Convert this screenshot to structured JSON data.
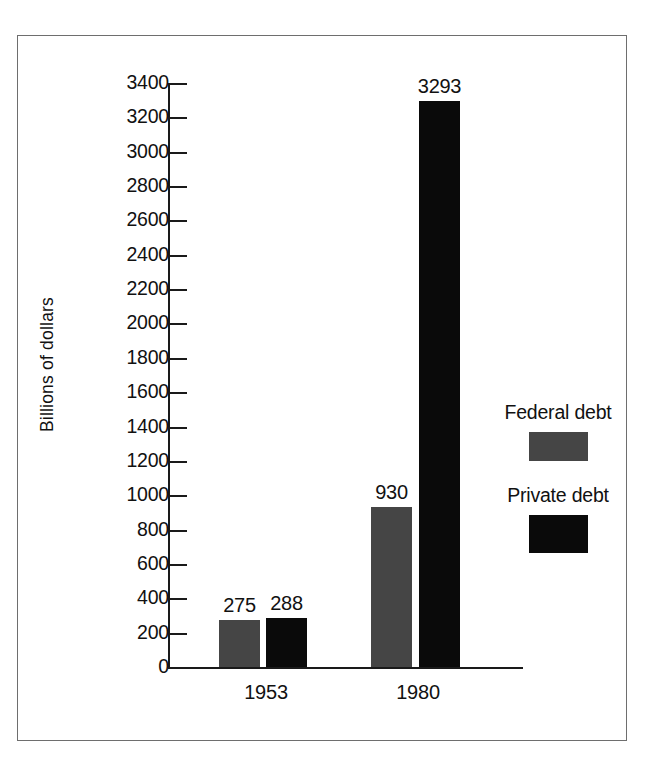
{
  "chart_data": {
    "type": "bar",
    "title": "",
    "subtitle": "",
    "xlabel": "",
    "ylabel": "Billions of dollars",
    "categories": [
      "1953",
      "1980"
    ],
    "series": [
      {
        "name": "Federal debt",
        "color": "#454545",
        "values": [
          275,
          930
        ]
      },
      {
        "name": "Private debt",
        "color": "#0a0a0a",
        "values": [
          288,
          3293
        ]
      }
    ],
    "value_labels": [
      {
        "text": "275",
        "series": "Federal debt",
        "category": "1953"
      },
      {
        "text": "288",
        "series": "Private debt",
        "category": "1953"
      },
      {
        "text": "930",
        "series": "Federal debt",
        "category": "1980"
      },
      {
        "text": "3293",
        "series": "Private debt",
        "category": "1980"
      }
    ],
    "ylim": [
      0,
      3400
    ],
    "ytick_step": 200,
    "ytick_labels": [
      "3400",
      "3200",
      "3000",
      "2800",
      "2600",
      "2400",
      "2200",
      "2000",
      "1800",
      "1600",
      "1400",
      "1200",
      "1000",
      "800",
      "600",
      "400",
      "200",
      "0"
    ],
    "grid": false,
    "legend_position": "right",
    "axis_color": "#1a1a1a",
    "frame_color": "#6e6e6e",
    "background": "#ffffff"
  },
  "axis": {
    "y_title": "Billions of dollars",
    "ticks": [
      {
        "label": "3400",
        "value": 3400
      },
      {
        "label": "3200",
        "value": 3200
      },
      {
        "label": "3000",
        "value": 3000
      },
      {
        "label": "2800",
        "value": 2800
      },
      {
        "label": "2600",
        "value": 2600
      },
      {
        "label": "2400",
        "value": 2400
      },
      {
        "label": "2200",
        "value": 2200
      },
      {
        "label": "2000",
        "value": 2000
      },
      {
        "label": "1800",
        "value": 1800
      },
      {
        "label": "1600",
        "value": 1600
      },
      {
        "label": "1400",
        "value": 1400
      },
      {
        "label": "1200",
        "value": 1200
      },
      {
        "label": "1000",
        "value": 1000
      },
      {
        "label": "800",
        "value": 800
      },
      {
        "label": "600",
        "value": 600
      },
      {
        "label": "400",
        "value": 400
      },
      {
        "label": "200",
        "value": 200
      },
      {
        "label": "0",
        "value": 0
      }
    ]
  },
  "groups": [
    {
      "label": "1953",
      "bars": [
        {
          "series": "Federal debt",
          "value": 275,
          "label": "275",
          "color": "#454545"
        },
        {
          "series": "Private debt",
          "value": 288,
          "label": "288",
          "color": "#0a0a0a"
        }
      ]
    },
    {
      "label": "1980",
      "bars": [
        {
          "series": "Federal debt",
          "value": 930,
          "label": "930",
          "color": "#454545"
        },
        {
          "series": "Private debt",
          "value": 3293,
          "label": "3293",
          "color": "#0a0a0a"
        }
      ]
    }
  ],
  "legend": {
    "entries": [
      {
        "label": "Federal debt",
        "color": "#454545"
      },
      {
        "label": "Private debt",
        "color": "#0a0a0a"
      }
    ]
  }
}
